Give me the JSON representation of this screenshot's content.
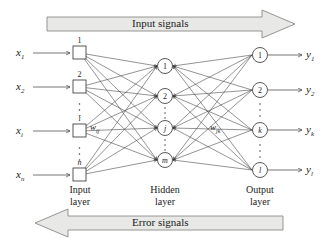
{
  "figure": {
    "background": "#ffffff",
    "line_color": "#3a3a3a",
    "band_fill": "#e8e8e6",
    "band_stroke": "#8a8a88"
  },
  "bands": {
    "top": {
      "label": "Input signals",
      "direction": "right"
    },
    "bottom": {
      "label": "Error signals",
      "direction": "left"
    }
  },
  "layers": {
    "input": {
      "name_line1": "Input",
      "name_line2": "layer",
      "shape": "square",
      "nodes": [
        {
          "id": "in-1",
          "label": "1",
          "italic": false,
          "signal": "x",
          "signal_sub": "1"
        },
        {
          "id": "in-2",
          "label": "2",
          "italic": false,
          "signal": "x",
          "signal_sub": "2"
        },
        {
          "id": "in-i",
          "label": "i",
          "italic": true,
          "signal": "x",
          "signal_sub": "i"
        },
        {
          "id": "in-n",
          "label": "n",
          "italic": true,
          "signal": "x",
          "signal_sub": "n"
        }
      ],
      "ellipsis_count": 2
    },
    "hidden": {
      "name_line1": "Hidden",
      "name_line2": "layer",
      "shape": "circle",
      "nodes": [
        {
          "id": "hid-1",
          "label": "1",
          "italic": false
        },
        {
          "id": "hid-2",
          "label": "2",
          "italic": false
        },
        {
          "id": "hid-j",
          "label": "j",
          "italic": true
        },
        {
          "id": "hid-m",
          "label": "m",
          "italic": true
        }
      ],
      "ellipsis_count": 2
    },
    "output": {
      "name_line1": "Output",
      "name_line2": "layer",
      "shape": "circle",
      "nodes": [
        {
          "id": "out-1",
          "label": "1",
          "italic": false,
          "signal": "y",
          "signal_sub": "1"
        },
        {
          "id": "out-2",
          "label": "2",
          "italic": false,
          "signal": "y",
          "signal_sub": "2"
        },
        {
          "id": "out-k",
          "label": "k",
          "italic": true,
          "signal": "y",
          "signal_sub": "k"
        },
        {
          "id": "out-l",
          "label": "l",
          "italic": true,
          "signal": "y",
          "signal_sub": "l"
        }
      ],
      "ellipsis_count": 2
    }
  },
  "weights": {
    "input_hidden": {
      "symbol": "w",
      "sub": "ij"
    },
    "hidden_output": {
      "symbol": "w",
      "sub": "jk"
    }
  }
}
